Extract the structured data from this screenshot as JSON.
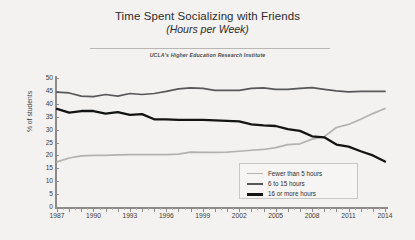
{
  "header": {
    "title": "Time Spent Socializing with Friends",
    "subtitle": "(Hours per Week)",
    "source": "UCLA's Higher Education Research Institute"
  },
  "colors": {
    "background": "#f3f2f0",
    "axis": "#8d8b89",
    "series_fewer_than_5": "#b3b2b0",
    "series_6_to_15": "#58585a",
    "series_16_or_more": "#141414",
    "legend_border": "#c9c7c4",
    "text": "#2b2b2b"
  },
  "chart_data": {
    "type": "line",
    "title": "Time Spent Socializing with Friends",
    "subtitle": "(Hours per Week)",
    "source": "UCLA's Higher Education Research Institute",
    "xlabel": "",
    "ylabel": "% of students",
    "xlim": [
      1987,
      2014
    ],
    "ylim": [
      0,
      50
    ],
    "yticks": [
      0,
      5,
      10,
      15,
      20,
      25,
      30,
      35,
      40,
      45,
      50
    ],
    "xticks": [
      1987,
      1990,
      1993,
      1996,
      1999,
      2002,
      2005,
      2008,
      2011,
      2014
    ],
    "grid": false,
    "legend_position": "bottom-right",
    "x": [
      1987,
      1988,
      1989,
      1990,
      1991,
      1992,
      1993,
      1994,
      1995,
      1996,
      1997,
      1998,
      1999,
      2000,
      2001,
      2002,
      2003,
      2004,
      2005,
      2006,
      2007,
      2008,
      2009,
      2010,
      2011,
      2012,
      2013,
      2014
    ],
    "series": [
      {
        "name": "Fewer than 5 hours",
        "color": "#b3b2b0",
        "values": [
          17.5,
          19.0,
          19.8,
          20.0,
          20.0,
          20.2,
          20.3,
          20.3,
          20.3,
          20.3,
          20.5,
          21.3,
          21.2,
          21.2,
          21.3,
          21.6,
          22.0,
          22.3,
          23.0,
          24.2,
          24.5,
          26.3,
          27.3,
          30.8,
          32.0,
          34.0,
          36.2,
          38.2
        ]
      },
      {
        "name": "6 to 15 hours",
        "color": "#58585a",
        "values": [
          44.5,
          44.2,
          43.0,
          42.8,
          43.6,
          43.0,
          44.0,
          43.6,
          44.0,
          44.8,
          45.8,
          46.2,
          46.0,
          45.2,
          45.2,
          45.2,
          46.0,
          46.2,
          45.6,
          45.6,
          46.0,
          46.3,
          45.6,
          45.0,
          44.6,
          44.8,
          44.8,
          44.8
        ]
      },
      {
        "name": "16 or more hours",
        "color": "#141414",
        "values": [
          38.0,
          36.6,
          37.2,
          37.2,
          36.2,
          36.8,
          35.7,
          36.0,
          34.0,
          34.0,
          33.8,
          33.8,
          33.8,
          33.6,
          33.4,
          33.2,
          32.0,
          31.6,
          31.4,
          30.2,
          29.5,
          27.4,
          27.0,
          24.2,
          23.4,
          21.6,
          20.0,
          17.6
        ]
      }
    ]
  },
  "legend": {
    "items": [
      {
        "label": "Fewer than 5 hours"
      },
      {
        "label": "6 to 15 hours"
      },
      {
        "label": "16 or more hours"
      }
    ]
  }
}
